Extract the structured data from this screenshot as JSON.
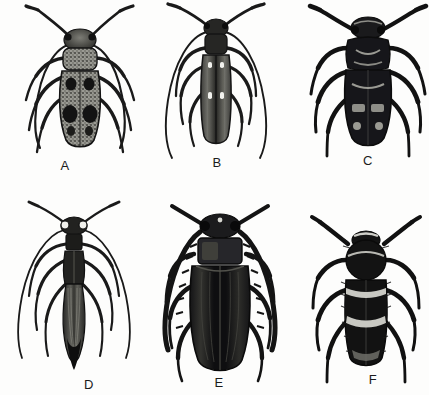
{
  "plate": {
    "title": "Comparative plate of six longhorn beetles",
    "description": "Black-and-white scientific line engraving of six beetle specimens in dorsal view, arranged in two rows of three, each captioned with a letter.",
    "medium": "halftone engraving",
    "background_color": "#fdfdfc",
    "ink_color": "#141414",
    "rows": 2,
    "columns": 3,
    "specimen_count": 6
  },
  "specimens": [
    {
      "id": "A",
      "label": "A",
      "label_x": 65,
      "label_y": 165,
      "center_x": 85,
      "center_y": 80,
      "common_description": "mottled gray longhorn beetle with dark elytral spots",
      "body_tone": "mottled gray speckled",
      "body_color": "#8b8b86",
      "markings": "two pairs of large black blotches on elytra",
      "antennae": "long, slender, swept outward and downward past the body",
      "body_width": 42,
      "body_length": 100,
      "row": 1,
      "column": 1
    },
    {
      "id": "B",
      "label": "B",
      "label_x": 217,
      "label_y": 162,
      "center_x": 215,
      "center_y": 78,
      "common_description": "narrow elongate longhorn beetle with pale elytral dots",
      "body_tone": "dark gray with fine longitudinal striations",
      "body_color": "#4a4a47",
      "markings": "two pairs of small white dots on the elytra",
      "antennae": "very long, arching outward then curving down well below the abdomen",
      "body_width": 26,
      "body_length": 108,
      "row": 1,
      "column": 2
    },
    {
      "id": "C",
      "label": "C",
      "label_x": 368,
      "label_y": 160,
      "center_x": 366,
      "center_y": 76,
      "common_description": "robust dark longhorn beetle with pale chevron markings",
      "body_tone": "near-black, heavy",
      "body_color": "#17171a",
      "markings": "pale gray chevrons and paired spots on the elytra and pronotum",
      "antennae": "stout, moderately long, angled up and outward",
      "body_width": 46,
      "body_length": 96,
      "row": 1,
      "column": 3
    },
    {
      "id": "D",
      "label": "D",
      "label_x": 89,
      "label_y": 384,
      "center_x": 72,
      "center_y": 285,
      "common_description": "slender wasp-like longhorn beetle with tapering abdomen",
      "body_tone": "dark with fine pale striations on the wings",
      "body_color": "#2e2e2c",
      "markings": "narrow wasp-like waist and elongate striated wings",
      "antennae": "long, thin, arching widely outward and downward",
      "body_width": 20,
      "body_length": 118,
      "row": 2,
      "column": 1
    },
    {
      "id": "E",
      "label": "E",
      "label_x": 219,
      "label_y": 382,
      "center_x": 217,
      "center_y": 285,
      "common_description": "large broad black longhorn beetle with serrated antennae",
      "body_tone": "glossy black with longitudinal ridges",
      "body_color": "#111113",
      "markings": "broad rectangular pronotum, ridged elytra",
      "antennae": "thick and serrate, sweeping down along the sides",
      "body_width": 62,
      "body_length": 128,
      "row": 2,
      "column": 2
    },
    {
      "id": "F",
      "label": "F",
      "label_x": 373,
      "label_y": 379,
      "center_x": 365,
      "center_y": 290,
      "common_description": "hairy banded longhorn beetle with pale transverse bands",
      "body_tone": "black with dense fuzzy pubescence",
      "body_color": "#121212",
      "markings": "pale transverse bands across the elytra and pronotum",
      "antennae": "short, bristly, angled sharply outward",
      "body_width": 40,
      "body_length": 104,
      "row": 2,
      "column": 3
    }
  ]
}
